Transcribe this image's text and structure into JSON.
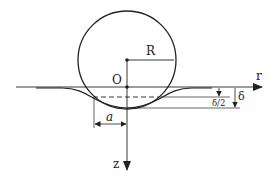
{
  "diagram": {
    "labels": {
      "radius": "R",
      "origin": "O",
      "r_axis": "r",
      "z_axis": "z",
      "contact_radius": "a",
      "indentation": "δ",
      "half_indentation": "δ/2"
    },
    "colors": {
      "stroke": "#222222",
      "background": "#ffffff"
    }
  }
}
